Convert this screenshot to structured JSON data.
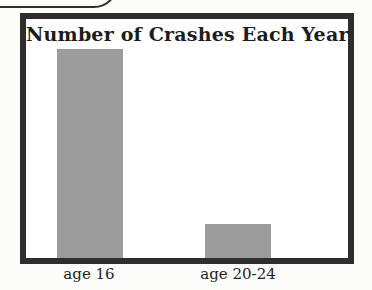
{
  "chart_data": {
    "type": "bar",
    "title": "Number of Crashes Each Year",
    "categories": [
      "age 16",
      "age 20-24"
    ],
    "values_relative_pct": [
      87.4,
      14.2
    ],
    "value_axis_labeled": false,
    "xlabel": "",
    "ylabel": "",
    "grid": false,
    "legend": "none",
    "bar_color": "#9c9c9c",
    "frame_color": "#2e2e2e",
    "plot_background": "#ffffff",
    "title_color": "#1c1c1c"
  }
}
